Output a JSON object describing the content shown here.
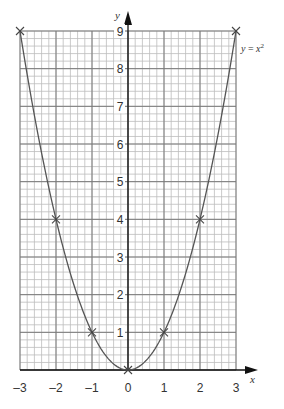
{
  "chart_data": {
    "type": "line",
    "title": "",
    "equation_label": "y = x²",
    "equation_label_parts": {
      "lhs": "y",
      "eq": " = ",
      "base": "x",
      "exp": "2"
    },
    "xlabel": "x",
    "ylabel": "y",
    "xlim": [
      -3,
      3
    ],
    "ylim": [
      0,
      9
    ],
    "x_ticks": [
      -3,
      -2,
      -1,
      0,
      1,
      2,
      3
    ],
    "x_tick_labels": [
      "–3",
      "–2",
      "–1",
      "0",
      "1",
      "2",
      "3"
    ],
    "y_ticks": [
      1,
      2,
      3,
      4,
      5,
      6,
      7,
      8,
      9
    ],
    "y_tick_labels": [
      "1",
      "2",
      "3",
      "4",
      "5",
      "6",
      "7",
      "8",
      "9"
    ],
    "grid": true,
    "minor_subdivisions": 5,
    "series": [
      {
        "name": "y = x²",
        "function": "x^2",
        "x": [
          -3,
          -2,
          -1,
          0,
          1,
          2,
          3
        ],
        "y": [
          9,
          4,
          1,
          0,
          1,
          4,
          9
        ],
        "marker": "x"
      }
    ],
    "colors": {
      "curve": "#555555",
      "grid_major": "#7a7a7a",
      "grid_minor": "#bdbdbd",
      "axis": "#111111",
      "background": "#ffffff"
    }
  }
}
